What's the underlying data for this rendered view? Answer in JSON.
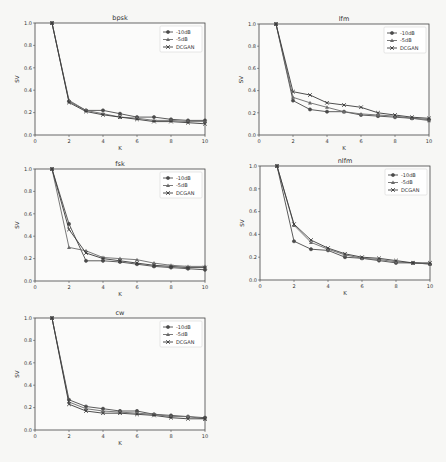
{
  "figure": {
    "layout": "3x2 grid of line charts (5 panels)",
    "background": "#f7f7f5"
  },
  "series_style": [
    {
      "name": "-10dB",
      "color": "#4a4a4a",
      "marker": "o"
    },
    {
      "name": "-5dB",
      "color": "#6a6a6a",
      "marker": "^"
    },
    {
      "name": "DCGAN",
      "color": "#3a3a3a",
      "marker": "x"
    }
  ],
  "chart_data": [
    {
      "type": "line",
      "title": "bpsk",
      "xlabel": "K",
      "ylabel": "SV",
      "x": [
        1,
        2,
        3,
        4,
        5,
        6,
        7,
        8,
        9,
        10
      ],
      "xticks": [
        "0",
        "2",
        "4",
        "6",
        "8",
        "10"
      ],
      "yticks": [
        "0.0",
        "0.2",
        "0.4",
        "0.6",
        "0.8",
        "1.0"
      ],
      "xlim": [
        0,
        10
      ],
      "ylim": [
        0,
        1.0
      ],
      "grid": false,
      "legend_position": "upper right",
      "series": [
        {
          "name": "-10dB",
          "values": [
            1.0,
            0.3,
            0.22,
            0.22,
            0.19,
            0.16,
            0.16,
            0.14,
            0.13,
            0.13
          ]
        },
        {
          "name": "-5dB",
          "values": [
            1.0,
            0.31,
            0.22,
            0.19,
            0.16,
            0.15,
            0.13,
            0.13,
            0.12,
            0.12
          ]
        },
        {
          "name": "DCGAN",
          "values": [
            1.0,
            0.29,
            0.21,
            0.18,
            0.16,
            0.14,
            0.12,
            0.12,
            0.11,
            0.1
          ]
        }
      ],
      "box": {
        "left": 35,
        "top": 23,
        "right": 205,
        "bottom": 135
      }
    },
    {
      "type": "line",
      "title": "lfm",
      "xlabel": "K",
      "ylabel": "SV",
      "x": [
        1,
        2,
        3,
        4,
        5,
        6,
        7,
        8,
        9,
        10
      ],
      "xticks": [
        "0",
        "2",
        "4",
        "6",
        "8",
        "10"
      ],
      "yticks": [
        "0.0",
        "0.2",
        "0.4",
        "0.6",
        "0.8",
        "1.0"
      ],
      "xlim": [
        0,
        10
      ],
      "ylim": [
        0,
        1.0
      ],
      "grid": false,
      "legend_position": "upper right",
      "series": [
        {
          "name": "-10dB",
          "values": [
            1.0,
            0.31,
            0.23,
            0.21,
            0.21,
            0.18,
            0.17,
            0.16,
            0.15,
            0.14
          ]
        },
        {
          "name": "-5dB",
          "values": [
            1.0,
            0.34,
            0.29,
            0.25,
            0.21,
            0.19,
            0.18,
            0.17,
            0.15,
            0.13
          ]
        },
        {
          "name": "DCGAN",
          "values": [
            1.0,
            0.39,
            0.36,
            0.29,
            0.27,
            0.25,
            0.2,
            0.18,
            0.16,
            0.15
          ]
        }
      ],
      "box": {
        "left": 259,
        "top": 24,
        "right": 429,
        "bottom": 135
      }
    },
    {
      "type": "line",
      "title": "fsk",
      "xlabel": "K",
      "ylabel": "SV",
      "x": [
        1,
        2,
        3,
        4,
        5,
        6,
        7,
        8,
        9,
        10
      ],
      "xticks": [
        "0",
        "2",
        "4",
        "6",
        "8",
        "10"
      ],
      "yticks": [
        "0.0",
        "0.2",
        "0.4",
        "0.6",
        "0.8",
        "1.0"
      ],
      "xlim": [
        0,
        10
      ],
      "ylim": [
        0,
        1.0
      ],
      "grid": false,
      "legend_position": "upper right",
      "series": [
        {
          "name": "-10dB",
          "values": [
            1.0,
            0.51,
            0.18,
            0.18,
            0.17,
            0.15,
            0.13,
            0.12,
            0.11,
            0.1
          ]
        },
        {
          "name": "-5dB",
          "values": [
            1.0,
            0.3,
            0.27,
            0.21,
            0.2,
            0.19,
            0.16,
            0.14,
            0.13,
            0.13
          ]
        },
        {
          "name": "DCGAN",
          "values": [
            1.0,
            0.46,
            0.25,
            0.2,
            0.18,
            0.16,
            0.14,
            0.13,
            0.12,
            0.12
          ]
        }
      ],
      "box": {
        "left": 35,
        "top": 169,
        "right": 205,
        "bottom": 281
      }
    },
    {
      "type": "line",
      "title": "nlfm",
      "xlabel": "K",
      "ylabel": "SV",
      "x": [
        1,
        2,
        3,
        4,
        5,
        6,
        7,
        8,
        9,
        10
      ],
      "xticks": [
        "0",
        "2",
        "4",
        "6",
        "8",
        "10"
      ],
      "yticks": [
        "0.0",
        "0.2",
        "0.4",
        "0.6",
        "0.8",
        "1.0"
      ],
      "xlim": [
        0,
        10
      ],
      "ylim": [
        0,
        1.0
      ],
      "grid": false,
      "legend_position": "upper right",
      "series": [
        {
          "name": "-10dB",
          "values": [
            1.0,
            0.34,
            0.27,
            0.26,
            0.2,
            0.19,
            0.17,
            0.15,
            0.15,
            0.14
          ]
        },
        {
          "name": "-5dB",
          "values": [
            1.0,
            0.48,
            0.33,
            0.27,
            0.22,
            0.19,
            0.18,
            0.16,
            0.15,
            0.14
          ]
        },
        {
          "name": "DCGAN",
          "values": [
            1.0,
            0.49,
            0.35,
            0.28,
            0.23,
            0.2,
            0.19,
            0.17,
            0.15,
            0.15
          ]
        }
      ],
      "box": {
        "left": 260,
        "top": 166,
        "right": 430,
        "bottom": 280
      }
    },
    {
      "type": "line",
      "title": "cw",
      "xlabel": "K",
      "ylabel": "SV",
      "x": [
        1,
        2,
        3,
        4,
        5,
        6,
        7,
        8,
        9,
        10
      ],
      "xticks": [
        "0",
        "2",
        "4",
        "6",
        "8",
        "10"
      ],
      "yticks": [
        "0.0",
        "0.2",
        "0.4",
        "0.6",
        "0.8",
        "1.0"
      ],
      "xlim": [
        0,
        10
      ],
      "ylim": [
        0,
        1.0
      ],
      "grid": false,
      "legend_position": "upper right",
      "series": [
        {
          "name": "-10dB",
          "values": [
            1.0,
            0.27,
            0.21,
            0.19,
            0.17,
            0.17,
            0.14,
            0.13,
            0.12,
            0.11
          ]
        },
        {
          "name": "-5dB",
          "values": [
            1.0,
            0.25,
            0.19,
            0.17,
            0.16,
            0.15,
            0.14,
            0.12,
            0.12,
            0.1
          ]
        },
        {
          "name": "DCGAN",
          "values": [
            1.0,
            0.23,
            0.17,
            0.15,
            0.15,
            0.14,
            0.13,
            0.11,
            0.1,
            0.1
          ]
        }
      ],
      "box": {
        "left": 35,
        "top": 318,
        "right": 205,
        "bottom": 430
      }
    }
  ]
}
